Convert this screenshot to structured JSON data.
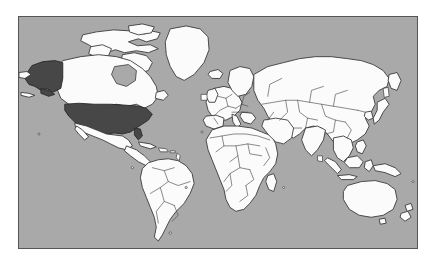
{
  "figure": {
    "name": "world-map",
    "type": "choropleth-world-map",
    "projection": "equirectangular",
    "frame": {
      "border_color": "#555555",
      "border_width_px": 1
    },
    "colors": {
      "ocean": "#a9a9a9",
      "land": "#fbfbfb",
      "land_border": "#3a3a3a",
      "highlight_fill": "#474747",
      "page_background": "#ffffff"
    },
    "highlighted_regions": [
      {
        "name": "United States (contiguous)",
        "fill": "#474747"
      },
      {
        "name": "United States (Alaska)",
        "fill": "#474747"
      }
    ],
    "labels": [],
    "legend": null,
    "title": null
  },
  "continents": [
    {
      "name": "North America"
    },
    {
      "name": "South America"
    },
    {
      "name": "Europe"
    },
    {
      "name": "Africa"
    },
    {
      "name": "Asia"
    },
    {
      "name": "Oceania"
    }
  ]
}
